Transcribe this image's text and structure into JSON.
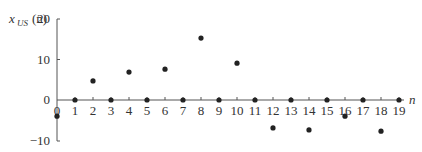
{
  "chart_data": {
    "type": "scatter",
    "title": "",
    "xlabel": "n",
    "ylabel": "x_US(n)",
    "ylabel_main": "x",
    "ylabel_sub": "US",
    "ylabel_arg": "(n)",
    "x": [
      0,
      1,
      2,
      3,
      4,
      5,
      6,
      7,
      8,
      9,
      10,
      11,
      12,
      13,
      14,
      15,
      16,
      17,
      18,
      19
    ],
    "values": [
      -4,
      0,
      4.7,
      0,
      6.9,
      0,
      7.6,
      0,
      15.3,
      0,
      9.1,
      0,
      -6.9,
      0,
      -7.4,
      0,
      -4,
      0,
      -7.7,
      0
    ],
    "xticks": [
      "0",
      "1",
      "2",
      "3",
      "4",
      "5",
      "6",
      "7",
      "8",
      "9",
      "10",
      "11",
      "12",
      "13",
      "14",
      "15",
      "16",
      "17",
      "18",
      "19"
    ],
    "yticks": [
      "20",
      "10",
      "0",
      "−10"
    ],
    "ytick_values": [
      20,
      10,
      0,
      -10
    ],
    "xlim": [
      0,
      19
    ],
    "ylim": [
      -10,
      20
    ],
    "grid": false,
    "legend": null
  }
}
